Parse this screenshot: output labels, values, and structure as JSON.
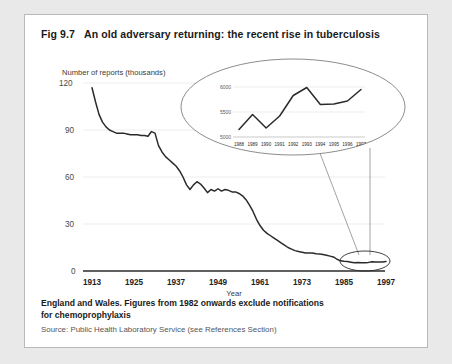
{
  "figure": {
    "number": "Fig 9.7",
    "title": "An old adversary returning: the recent rise in tuberculosis"
  },
  "footnote": {
    "main_line1": "England and Wales. Figures from 1982 onwards exclude notifications",
    "main_line2": "for chemoprophylaxis",
    "source": "Source: Public Health Laboratory Service (see References Section)"
  },
  "colors": {
    "panel_background": "#ffffff",
    "page_background": "#e9e9e9",
    "panel_border": "#b9b9b9",
    "line": "#2b2b2b",
    "gridline": "#ededed",
    "axis": "#2b2b2b",
    "text": "#1a1a1a"
  },
  "chart_data": {
    "type": "line",
    "title": "An old adversary returning: the recent rise in tuberculosis",
    "xlabel": "Year",
    "ylabel": "Number of reports (thousands)",
    "xlim": [
      1913,
      1999
    ],
    "ylim": [
      0,
      120
    ],
    "grid": true,
    "legend": null,
    "yticks": [
      0,
      30,
      60,
      90,
      120
    ],
    "ytick_labels": [
      "0",
      "30",
      "60",
      "90",
      "120"
    ],
    "xticks": [
      1913,
      1925,
      1937,
      1949,
      1961,
      1973,
      1985,
      1997
    ],
    "xtick_labels": [
      "1913",
      "1925",
      "1937",
      "1949",
      "1961",
      "1973",
      "1985",
      "1997"
    ],
    "x": [
      1913,
      1914,
      1915,
      1916,
      1917,
      1918,
      1919,
      1920,
      1921,
      1922,
      1923,
      1924,
      1925,
      1926,
      1927,
      1928,
      1929,
      1930,
      1931,
      1932,
      1933,
      1934,
      1935,
      1936,
      1937,
      1938,
      1939,
      1940,
      1941,
      1942,
      1943,
      1944,
      1945,
      1946,
      1947,
      1948,
      1949,
      1950,
      1951,
      1952,
      1953,
      1954,
      1955,
      1956,
      1957,
      1958,
      1959,
      1960,
      1961,
      1962,
      1963,
      1964,
      1965,
      1966,
      1967,
      1968,
      1969,
      1970,
      1971,
      1972,
      1973,
      1974,
      1975,
      1976,
      1977,
      1978,
      1979,
      1980,
      1981,
      1982,
      1983,
      1984,
      1985,
      1986,
      1987,
      1988,
      1989,
      1990,
      1991,
      1992,
      1993,
      1994,
      1995,
      1996,
      1997
    ],
    "values": [
      117,
      108,
      100,
      95,
      92,
      90,
      89,
      88,
      88,
      88,
      87.5,
      87,
      87,
      87,
      86.5,
      86.5,
      86,
      89,
      88,
      80,
      76,
      73,
      71,
      69,
      67,
      64,
      60,
      55,
      52,
      55,
      57,
      55.5,
      53,
      50,
      52,
      51,
      52.5,
      51,
      52,
      51.5,
      50.5,
      50.5,
      49.5,
      48,
      45.5,
      42,
      38,
      33,
      29,
      26,
      24,
      22.5,
      21,
      19.5,
      18,
      16.5,
      15,
      14,
      13,
      12.5,
      12,
      11.5,
      11.5,
      11.5,
      11,
      10.8,
      10.5,
      10,
      9.5,
      9,
      7.5,
      6.5,
      6.2,
      6,
      5.6,
      5.2,
      5.4,
      5.2,
      5.3,
      5.5,
      5.9,
      5.7,
      5.7,
      5.8,
      6.0
    ],
    "series_name": "Tuberculosis reports",
    "annotation": {
      "type": "callout-ellipse",
      "description": "Magnified inset showing 1988-1997 detail",
      "marker_years": [
        1988,
        1997
      ]
    }
  },
  "inset_chart": {
    "type": "line",
    "xlabel": "",
    "ylabel": "",
    "ylim": [
      5000,
      6100
    ],
    "grid": true,
    "yticks": [
      5000,
      5500,
      6000
    ],
    "ytick_labels": [
      "5000",
      "5500",
      "6000"
    ],
    "xtick_labels": [
      "1988",
      "1989",
      "1990",
      "1991",
      "1992",
      "1993",
      "1994",
      "1995",
      "1996",
      "1997"
    ],
    "x": [
      1988,
      1989,
      1990,
      1991,
      1992,
      1993,
      1994,
      1995,
      1996,
      1997
    ],
    "values": [
      5150,
      5450,
      5180,
      5420,
      5830,
      5990,
      5650,
      5660,
      5720,
      5950
    ]
  }
}
